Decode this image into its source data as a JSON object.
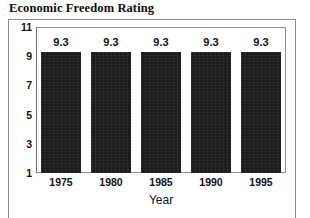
{
  "chart_data": {
    "type": "bar",
    "title": "Economic Freedom Rating",
    "xlabel": "Year",
    "ylabel": "",
    "categories": [
      "1975",
      "1980",
      "1985",
      "1990",
      "1995"
    ],
    "values": [
      9.3,
      9.3,
      9.3,
      9.3,
      9.3
    ],
    "data_labels": [
      "9.3",
      "9.3",
      "9.3",
      "9.3",
      "9.3"
    ],
    "ylim": [
      1,
      11
    ],
    "yticks": [
      11,
      9,
      7,
      5,
      3,
      1
    ],
    "ytick_labels": [
      "11",
      "9",
      "7",
      "5",
      "3",
      "1"
    ],
    "grid": false,
    "legend": false,
    "bar_color": "#1b1b1b",
    "axis_color": "#6e6e6e",
    "frame_color": "#8c8c8c",
    "background": "#ffffff"
  }
}
